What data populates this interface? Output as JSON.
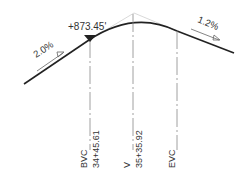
{
  "diagram": {
    "type": "vertical-curve-profile",
    "elevation_label": "+873.45'",
    "grade_in": "2.0%",
    "grade_out": "1.2%",
    "stations": [
      {
        "name": "BVC",
        "station": "34+45.61"
      },
      {
        "name": "V",
        "station": "35+35.92"
      },
      {
        "name": "EVC",
        "station": ""
      }
    ],
    "colors": {
      "line": "#222222",
      "dim": "#888888",
      "text": "#333333"
    }
  }
}
